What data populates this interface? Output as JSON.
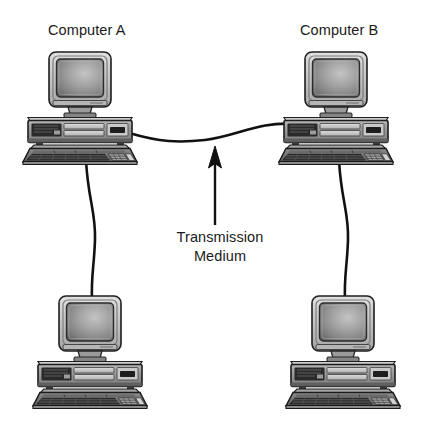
{
  "diagram": {
    "title_labels": {
      "computer_a": "Computer A",
      "computer_b": "Computer B"
    },
    "annotation": {
      "line1": "Transmission",
      "line2": "Medium"
    },
    "nodes": [
      {
        "id": "computer-a-top",
        "label": "Computer A",
        "position": "top-left"
      },
      {
        "id": "computer-b-top",
        "label": "Computer B",
        "position": "top-right"
      },
      {
        "id": "computer-a-bottom",
        "label": "",
        "position": "bottom-left"
      },
      {
        "id": "computer-b-bottom",
        "label": "",
        "position": "bottom-right"
      }
    ],
    "connections": [
      {
        "from": "computer-a-top",
        "to": "computer-b-top",
        "style": "s-curve-horizontal"
      },
      {
        "from": "computer-a-top",
        "to": "computer-a-bottom",
        "style": "vertical-curve"
      },
      {
        "from": "computer-b-top",
        "to": "computer-b-bottom",
        "style": "vertical-curve"
      }
    ],
    "pointer": {
      "name": "transmission-medium-arrow",
      "direction": "up",
      "points_to": "connection-cable"
    },
    "colors": {
      "background": "#ffffff",
      "ink": "#1a1a1a",
      "cable": "#111111",
      "case_light": "#c8c8c8",
      "case_mid": "#9a9a9a",
      "case_dark": "#3a3a3a",
      "screen_light": "#b4b4b4",
      "screen_dark": "#6e6e6e",
      "bezel": "#d2d2d2",
      "outline": "#222222"
    }
  }
}
